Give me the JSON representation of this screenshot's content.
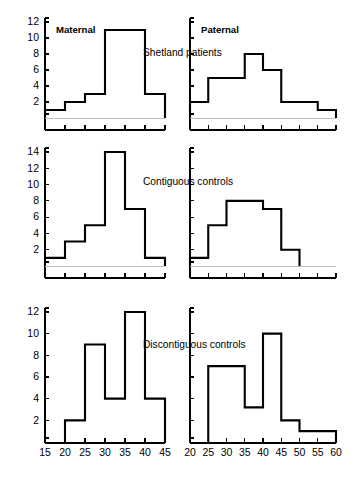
{
  "figure": {
    "column_headings": [
      {
        "id": "maternal",
        "label": "Maternal"
      },
      {
        "id": "paternal",
        "label": "Paternal"
      }
    ],
    "row_titles": [
      {
        "id": "shetland-patients",
        "label": "Shetland patients"
      },
      {
        "id": "contiguous-controls",
        "label": "Contiguous controls"
      },
      {
        "id": "discontiguous-controls",
        "label": "Discontiguous controls"
      }
    ],
    "colors": {
      "ink": "#000000",
      "background": "#ffffff",
      "baseline": "#b9b9b9"
    }
  },
  "chart_data": [
    {
      "id": "shetland-maternal",
      "type": "bar",
      "title": "Shetland patients",
      "subtitle": "Maternal",
      "xlabel": "",
      "ylabel": "",
      "xlim": [
        15,
        45
      ],
      "ylim": [
        0,
        12
      ],
      "grid": false,
      "legend": "none",
      "bin_width": 5,
      "xticks": [
        15,
        20,
        25,
        30,
        35,
        40,
        45
      ],
      "yticks": [
        2,
        4,
        6,
        8,
        10,
        12
      ],
      "bin_starts": [
        15,
        20,
        25,
        30,
        35,
        40
      ],
      "categories": [
        "15-20",
        "20-25",
        "25-30",
        "30-35",
        "35-40",
        "40-45"
      ],
      "values": [
        1,
        2,
        3,
        11,
        11,
        3
      ]
    },
    {
      "id": "shetland-paternal",
      "type": "bar",
      "title": "Shetland patients",
      "subtitle": "Paternal",
      "xlabel": "",
      "ylabel": "",
      "xlim": [
        20,
        60
      ],
      "ylim": [
        0,
        12
      ],
      "grid": false,
      "legend": "none",
      "bin_width": 5,
      "xticks": [
        20,
        25,
        30,
        35,
        40,
        45,
        50,
        55,
        60
      ],
      "yticks": [
        2,
        4,
        6,
        8,
        10,
        12
      ],
      "bin_starts": [
        20,
        25,
        30,
        35,
        40,
        45,
        50,
        55
      ],
      "categories": [
        "20-25",
        "25-30",
        "30-35",
        "35-40",
        "40-45",
        "45-50",
        "50-55",
        "55-60"
      ],
      "values": [
        2,
        5,
        5,
        8,
        6,
        2,
        2,
        1
      ]
    },
    {
      "id": "contiguous-maternal",
      "type": "bar",
      "title": "Contiguous controls",
      "subtitle": "Maternal",
      "xlabel": "",
      "ylabel": "",
      "xlim": [
        15,
        45
      ],
      "ylim": [
        0,
        14
      ],
      "grid": false,
      "legend": "none",
      "bin_width": 5,
      "xticks": [
        15,
        20,
        25,
        30,
        35,
        40,
        45
      ],
      "yticks": [
        2,
        4,
        6,
        8,
        10,
        12,
        14
      ],
      "bin_starts": [
        15,
        20,
        25,
        30,
        35,
        40
      ],
      "categories": [
        "15-20",
        "20-25",
        "25-30",
        "30-35",
        "35-40",
        "40-45"
      ],
      "values": [
        1,
        3,
        5,
        14,
        7,
        1
      ]
    },
    {
      "id": "contiguous-paternal",
      "type": "bar",
      "title": "Contiguous controls",
      "subtitle": "Paternal",
      "xlabel": "",
      "ylabel": "",
      "xlim": [
        20,
        60
      ],
      "ylim": [
        0,
        14
      ],
      "grid": false,
      "legend": "none",
      "bin_width": 5,
      "xticks": [
        20,
        25,
        30,
        35,
        40,
        45,
        50,
        55,
        60
      ],
      "yticks": [
        2,
        4,
        6,
        8,
        10,
        12,
        14
      ],
      "bin_starts": [
        20,
        25,
        30,
        35,
        40,
        45
      ],
      "categories": [
        "20-25",
        "25-30",
        "30-35",
        "35-40",
        "40-45",
        "45-50"
      ],
      "values": [
        1,
        5,
        8,
        8,
        7,
        2
      ]
    },
    {
      "id": "discontiguous-maternal",
      "type": "bar",
      "title": "Discontiguous controls",
      "subtitle": "Maternal",
      "xlabel": "",
      "ylabel": "",
      "xlim": [
        15,
        45
      ],
      "ylim": [
        0,
        12
      ],
      "grid": false,
      "legend": "none",
      "bin_width": 5,
      "xticks": [
        15,
        20,
        25,
        30,
        35,
        40,
        45
      ],
      "yticks": [
        2,
        4,
        6,
        8,
        10,
        12
      ],
      "bin_starts": [
        20,
        25,
        30,
        35,
        40
      ],
      "categories": [
        "20-25",
        "25-30",
        "30-35",
        "35-40",
        "40-45"
      ],
      "values": [
        2,
        9,
        4,
        12,
        4
      ]
    },
    {
      "id": "discontiguous-paternal",
      "type": "bar",
      "title": "Discontiguous controls",
      "subtitle": "Paternal",
      "xlabel": "",
      "ylabel": "",
      "xlim": [
        20,
        60
      ],
      "ylim": [
        0,
        12
      ],
      "grid": false,
      "legend": "none",
      "bin_width": 5,
      "xticks": [
        20,
        25,
        30,
        35,
        40,
        45,
        50,
        55,
        60
      ],
      "yticks": [
        2,
        4,
        6,
        8,
        10,
        12
      ],
      "bin_starts": [
        25,
        30,
        35,
        40,
        45,
        50,
        55
      ],
      "categories": [
        "25-30",
        "30-35",
        "35-40",
        "40-45",
        "45-50",
        "50-55",
        "55-60"
      ],
      "values": [
        7,
        7,
        3.2,
        10,
        2,
        1,
        1
      ]
    }
  ],
  "axis_labels": {
    "left_xticks": [
      "15",
      "20",
      "25",
      "30",
      "35",
      "40",
      "45"
    ],
    "right_xticks": [
      "20",
      "25",
      "30",
      "35",
      "40",
      "45",
      "50",
      "55",
      "60"
    ],
    "row1_yticks": [
      "2",
      "4",
      "6",
      "8",
      "10",
      "12"
    ],
    "row2_yticks": [
      "2",
      "4",
      "6",
      "8",
      "10",
      "12",
      "14"
    ],
    "row3_yticks": [
      "2",
      "4",
      "6",
      "8",
      "10",
      "12"
    ]
  }
}
